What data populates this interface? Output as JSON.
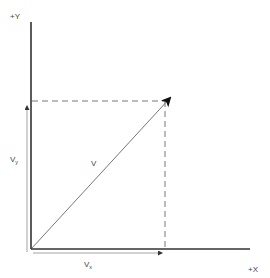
{
  "diagram": {
    "type": "vector-decomposition",
    "labels": {
      "y_axis": "+Y",
      "x_axis": "+X",
      "vector": "V",
      "vy": "V",
      "vy_sub": "y",
      "vx": "V",
      "vx_sub": "x"
    },
    "colors": {
      "axis": "#333333",
      "vector": "#555555",
      "dashed": "#777777",
      "component": "#777777",
      "text": "#444444"
    }
  }
}
